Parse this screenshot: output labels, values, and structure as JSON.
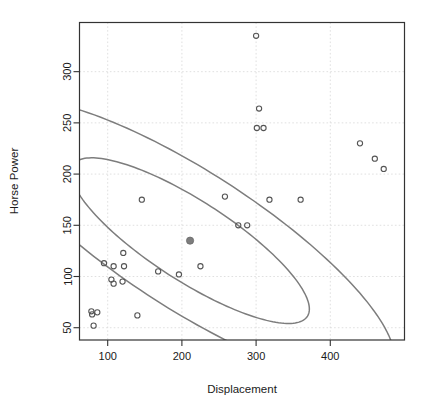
{
  "chart_data": {
    "type": "scatter",
    "title": "",
    "xlabel": "Displacement",
    "ylabel": "Horse Power",
    "xlim": [
      62,
      500
    ],
    "ylim": [
      38,
      348
    ],
    "xticks": [
      100,
      200,
      300,
      400
    ],
    "xtick_labels": [
      "100",
      "200",
      "300",
      "400"
    ],
    "yticks": [
      50,
      100,
      150,
      200,
      250,
      300
    ],
    "ytick_labels": [
      "50",
      "100",
      "150",
      "200",
      "250",
      "300"
    ],
    "grid": true,
    "grid_style": "dotted",
    "legend": "none",
    "point_marker": "open-circle",
    "point_color": "#555555",
    "ellipse_color": "#7d7d7d",
    "centroid": {
      "x": 211,
      "y": 135,
      "marker": "filled-circle",
      "color": "#7d7d7d"
    },
    "annotations": [
      "inner confidence ellipse",
      "outer confidence ellipse"
    ],
    "series": [
      {
        "name": "cars",
        "points": [
          {
            "x": 78,
            "y": 66
          },
          {
            "x": 79,
            "y": 63
          },
          {
            "x": 86,
            "y": 65
          },
          {
            "x": 81,
            "y": 52
          },
          {
            "x": 95,
            "y": 113
          },
          {
            "x": 105,
            "y": 97
          },
          {
            "x": 108,
            "y": 110
          },
          {
            "x": 108,
            "y": 93
          },
          {
            "x": 120,
            "y": 95
          },
          {
            "x": 121,
            "y": 123
          },
          {
            "x": 122,
            "y": 110
          },
          {
            "x": 140,
            "y": 62
          },
          {
            "x": 146,
            "y": 175
          },
          {
            "x": 168,
            "y": 105
          },
          {
            "x": 196,
            "y": 102
          },
          {
            "x": 225,
            "y": 110
          },
          {
            "x": 258,
            "y": 178
          },
          {
            "x": 276,
            "y": 150
          },
          {
            "x": 288,
            "y": 150
          },
          {
            "x": 300,
            "y": 335
          },
          {
            "x": 304,
            "y": 264
          },
          {
            "x": 301,
            "y": 245
          },
          {
            "x": 310,
            "y": 245
          },
          {
            "x": 318,
            "y": 175
          },
          {
            "x": 360,
            "y": 175
          },
          {
            "x": 440,
            "y": 230
          },
          {
            "x": 460,
            "y": 215
          },
          {
            "x": 472,
            "y": 205
          }
        ]
      }
    ],
    "ellipses": [
      {
        "name": "inner",
        "cx": 211,
        "cy": 135,
        "semi_major": 175,
        "semi_minor": 42,
        "rotation_deg": -24
      },
      {
        "name": "outer",
        "cx": 211,
        "cy": 135,
        "semi_major": 300,
        "semi_minor": 72,
        "rotation_deg": -24
      }
    ]
  }
}
